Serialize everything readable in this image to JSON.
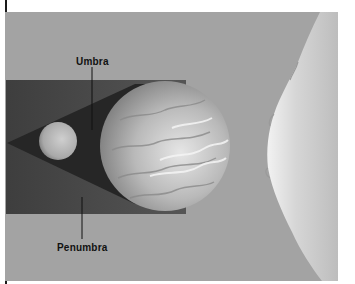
{
  "figure": {
    "title": "",
    "labels": {
      "umbra": "Umbra",
      "penumbra": "Penumbra"
    },
    "objects": {
      "sun": "sun-limb",
      "earth": "earth-globe",
      "moon": "moon-globe"
    },
    "colors": {
      "background": "#a3a3a3",
      "penumbra": "#4b4b4b",
      "umbra": "#262626",
      "sun": "#dcdcdc",
      "earth": "#b8b8b8",
      "moon": "#b0b0b0",
      "label_text": "#111111"
    }
  }
}
